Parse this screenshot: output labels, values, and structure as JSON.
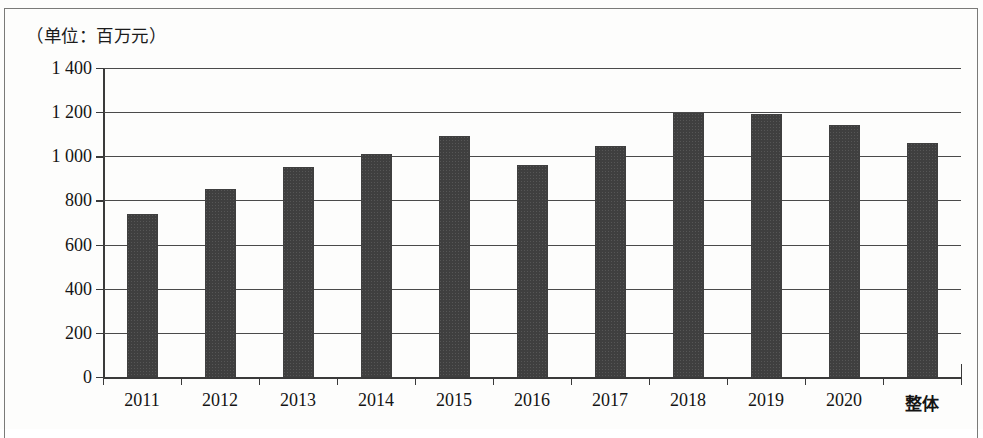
{
  "figure": {
    "unit_note": "（单位：百万元）"
  },
  "chart_data": {
    "type": "bar",
    "title": "",
    "subtitle": "",
    "xlabel": "",
    "ylabel": "（单位：百万元）",
    "categories": [
      "2011",
      "2012",
      "2013",
      "2014",
      "2015",
      "2016",
      "2017",
      "2018",
      "2019",
      "2020",
      "整体"
    ],
    "values": [
      740,
      850,
      950,
      1010,
      1090,
      960,
      1045,
      1195,
      1193,
      1140,
      1060
    ],
    "ylim": [
      0,
      1400
    ],
    "yticks": [
      0,
      200,
      400,
      600,
      800,
      1000,
      1200,
      1400
    ],
    "ytick_labels": [
      "0",
      "200",
      "400",
      "600",
      "800",
      "1 000",
      "1 200",
      "1 400"
    ],
    "grid": true,
    "legend": null,
    "bar_color": "#3f3f3f",
    "axis_color": "#3a3a3a"
  }
}
